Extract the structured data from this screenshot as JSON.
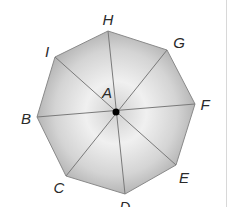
{
  "diagram": {
    "shape": "regular octagon",
    "center": {
      "label": "A",
      "x": 116,
      "y": 112
    },
    "vertices": [
      {
        "label": "H",
        "x": 108,
        "y": 31,
        "lx": 108,
        "ly": 25
      },
      {
        "label": "G",
        "x": 167,
        "y": 50,
        "lx": 179,
        "ly": 48
      },
      {
        "label": "F",
        "x": 195,
        "y": 104,
        "lx": 205,
        "ly": 110
      },
      {
        "label": "E",
        "x": 176,
        "y": 165,
        "lx": 184,
        "ly": 183
      },
      {
        "label": "D",
        "x": 125,
        "y": 194,
        "lx": 125,
        "ly": 212
      },
      {
        "label": "C",
        "x": 66,
        "y": 176,
        "lx": 59,
        "ly": 193
      },
      {
        "label": "B",
        "x": 37,
        "y": 117,
        "lx": 26,
        "ly": 124
      },
      {
        "label": "I",
        "x": 55,
        "y": 57,
        "lx": 47,
        "ly": 57
      }
    ],
    "center_label": {
      "text": "A",
      "x": 107,
      "y": 98
    },
    "diagonals": [
      [
        "H",
        "D"
      ],
      [
        "G",
        "C"
      ],
      [
        "F",
        "B"
      ],
      [
        "E",
        "I"
      ]
    ],
    "colors": {
      "fill_light": "#f2f2f2",
      "fill_dark": "#a9a9a9",
      "edge": "#8a8a8a",
      "line": "#7a7a7a",
      "center_dot": "#000000",
      "label": "#2a2a2a"
    }
  }
}
